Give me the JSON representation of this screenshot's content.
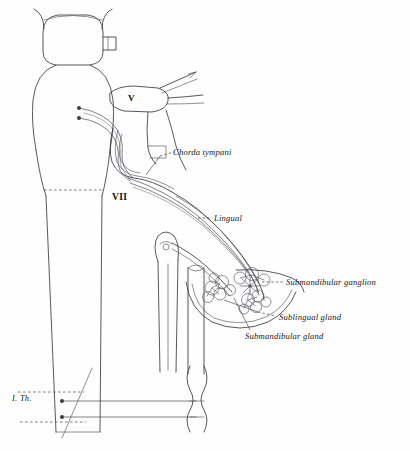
{
  "figure": {
    "line_color": "#3a3a42",
    "background": "#ffffff"
  },
  "labels": {
    "chorda_tympani": "Chorda tympani",
    "lingual": "Lingual",
    "submandibular_ganglion": "Submandibular ganglion",
    "sublingual_gland": "Sublingual gland",
    "submandibular_gland": "Submandibular gland"
  },
  "nerve_numerals": {
    "trigeminal": "V",
    "facial": "VII"
  },
  "spinal_segments": {
    "first_thoracic": "I. Th."
  }
}
